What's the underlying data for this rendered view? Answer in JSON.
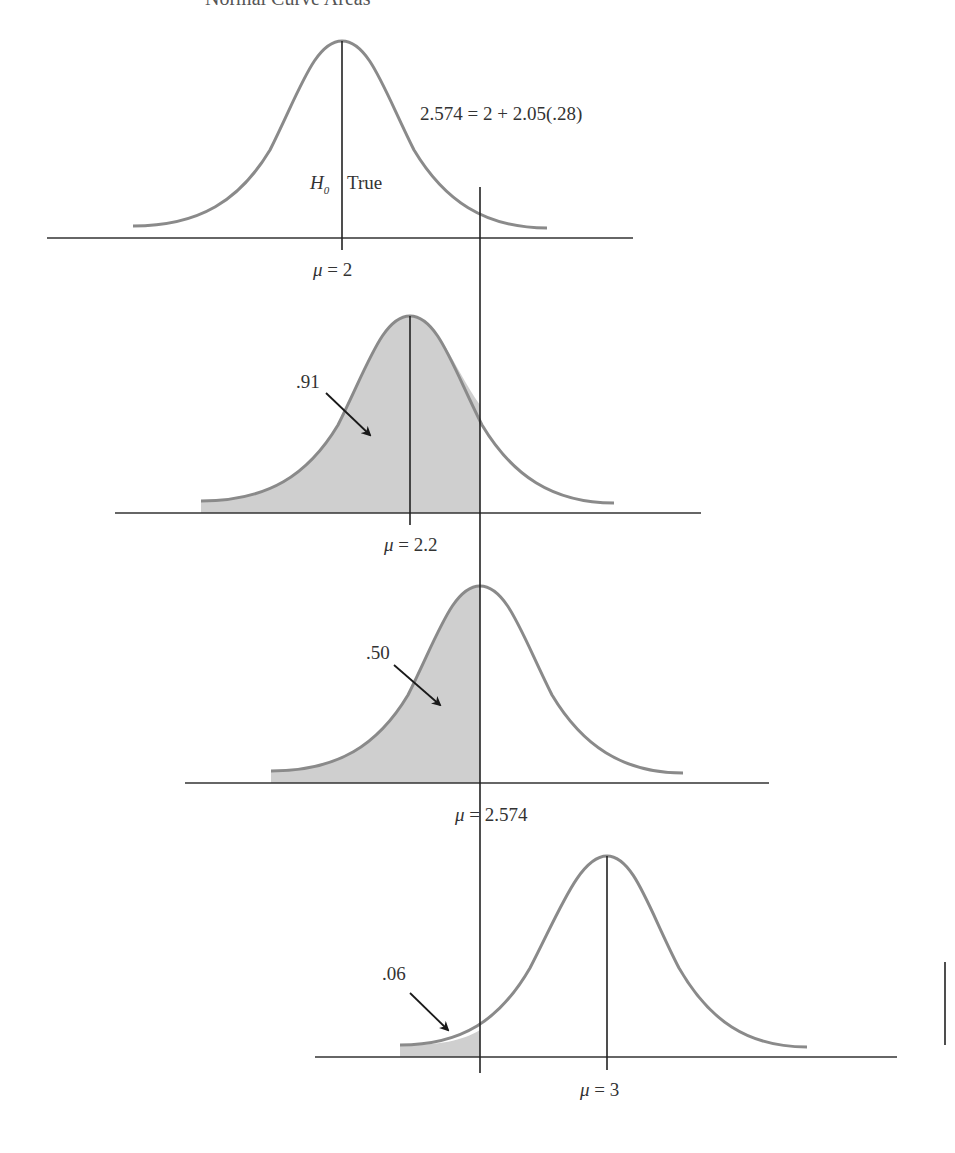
{
  "title": "Normal Curve Areas",
  "formula": "2.574 = 2 + 2.05(.28)",
  "critical_value": 2.574,
  "colors": {
    "curve": "#8a8a8a",
    "shade": "#cfcfcf",
    "line": "#222222",
    "text": "#333333"
  },
  "panels": [
    {
      "name": "h0-true",
      "label_h0": "H",
      "label_h0_sub": "0",
      "label_h0_text": "True",
      "mu_symbol": "μ",
      "mu_text": " = 2",
      "mean": 2,
      "shaded_area_label": null,
      "shaded": false
    },
    {
      "name": "mu-2.2",
      "mu_symbol": "μ",
      "mu_text": " = 2.2",
      "mean": 2.2,
      "shaded_area_label": ".91",
      "shaded": true
    },
    {
      "name": "mu-2.574",
      "mu_symbol": "μ",
      "mu_text": " = 2.574",
      "mean": 2.574,
      "shaded_area_label": ".50",
      "shaded": true
    },
    {
      "name": "mu-3",
      "mu_symbol": "μ",
      "mu_text": " = 3",
      "mean": 3,
      "shaded_area_label": ".06",
      "shaded": true
    }
  ]
}
